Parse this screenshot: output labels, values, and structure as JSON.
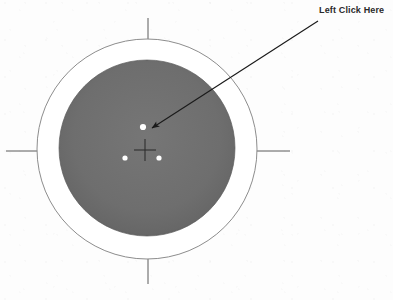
{
  "image": {
    "width": 393,
    "height": 300,
    "background_color": "#fdfdfd",
    "kind": "scanned-diagram"
  },
  "annotation": {
    "label": "Left Click Here",
    "label_color": "#2a2a2a",
    "label_x": 319,
    "label_y": 4,
    "arrow": {
      "start_x": 318,
      "start_y": 21,
      "end_x": 150,
      "end_y": 128,
      "color": "#1a1a1a",
      "head_style": "solid-filled"
    }
  },
  "target": {
    "center_x": 147,
    "center_y": 149,
    "outer_circle": {
      "radius": 110,
      "stroke_color": "#8d8d8d",
      "fill_color": "#ffffff",
      "stroke_width": 1
    },
    "inner_circle": {
      "radius": 88,
      "fill_color": "#6e6e6e",
      "edge_shadow_color": "#5a5a5a"
    },
    "crosshair": {
      "center_x": 145,
      "center_y": 150,
      "arm_length": 11,
      "color": "#2e2e2e"
    },
    "tick_marks": [
      {
        "name": "north-tick",
        "x1": 148,
        "y1": 18,
        "x2": 148,
        "y2": 44
      },
      {
        "name": "south-tick",
        "x1": 148,
        "y1": 254,
        "x2": 148,
        "y2": 284
      },
      {
        "name": "west-tick",
        "x1": 6,
        "y1": 151,
        "x2": 40,
        "y2": 151
      },
      {
        "name": "east-tick",
        "x1": 256,
        "y1": 151,
        "x2": 290,
        "y2": 151
      }
    ],
    "tick_color": "#5a5a5a",
    "markers": [
      {
        "name": "marker-top",
        "x": 143,
        "y": 127,
        "r": 3.1,
        "color": "#ffffff"
      },
      {
        "name": "marker-bottom-left",
        "x": 125,
        "y": 158,
        "r": 2.6,
        "color": "#ffffff"
      },
      {
        "name": "marker-bottom-right",
        "x": 159,
        "y": 158,
        "r": 2.6,
        "color": "#ffffff"
      }
    ]
  }
}
